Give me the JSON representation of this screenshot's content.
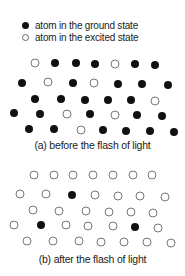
{
  "legend": {
    "ground_label": "atom in the ground state",
    "excited_label": "atom in the excited state"
  },
  "panel_a": {
    "caption": "(a) before the flash of light",
    "atoms": [
      {
        "x": 35,
        "y": 63,
        "state": "excited"
      },
      {
        "x": 55,
        "y": 63,
        "state": "ground"
      },
      {
        "x": 76,
        "y": 63,
        "state": "ground"
      },
      {
        "x": 95,
        "y": 64,
        "state": "ground"
      },
      {
        "x": 115,
        "y": 64,
        "state": "excited"
      },
      {
        "x": 135,
        "y": 64,
        "state": "ground"
      },
      {
        "x": 155,
        "y": 65,
        "state": "ground"
      },
      {
        "x": 22,
        "y": 83,
        "state": "ground"
      },
      {
        "x": 48,
        "y": 82,
        "state": "excited"
      },
      {
        "x": 73,
        "y": 83,
        "state": "ground"
      },
      {
        "x": 94,
        "y": 83,
        "state": "excited"
      },
      {
        "x": 118,
        "y": 84,
        "state": "ground"
      },
      {
        "x": 142,
        "y": 84,
        "state": "ground"
      },
      {
        "x": 168,
        "y": 85,
        "state": "ground"
      },
      {
        "x": 35,
        "y": 99,
        "state": "ground"
      },
      {
        "x": 61,
        "y": 99,
        "state": "ground"
      },
      {
        "x": 85,
        "y": 100,
        "state": "ground"
      },
      {
        "x": 108,
        "y": 100,
        "state": "ground"
      },
      {
        "x": 131,
        "y": 100,
        "state": "ground"
      },
      {
        "x": 155,
        "y": 101,
        "state": "excited"
      },
      {
        "x": 14,
        "y": 113,
        "state": "ground"
      },
      {
        "x": 40,
        "y": 114,
        "state": "ground"
      },
      {
        "x": 67,
        "y": 114,
        "state": "excited"
      },
      {
        "x": 90,
        "y": 114,
        "state": "ground"
      },
      {
        "x": 115,
        "y": 115,
        "state": "excited"
      },
      {
        "x": 137,
        "y": 115,
        "state": "ground"
      },
      {
        "x": 162,
        "y": 116,
        "state": "ground"
      },
      {
        "x": 29,
        "y": 129,
        "state": "ground"
      },
      {
        "x": 54,
        "y": 129,
        "state": "ground"
      },
      {
        "x": 81,
        "y": 130,
        "state": "excited"
      },
      {
        "x": 103,
        "y": 130,
        "state": "ground"
      },
      {
        "x": 126,
        "y": 131,
        "state": "ground"
      },
      {
        "x": 150,
        "y": 131,
        "state": "ground"
      },
      {
        "x": 174,
        "y": 132,
        "state": "ground"
      }
    ]
  },
  "panel_b": {
    "caption": "(b) after the flash of light",
    "atoms": [
      {
        "x": 34,
        "y": 175,
        "state": "excited"
      },
      {
        "x": 54,
        "y": 175,
        "state": "excited"
      },
      {
        "x": 73,
        "y": 175,
        "state": "excited"
      },
      {
        "x": 93,
        "y": 175,
        "state": "excited"
      },
      {
        "x": 113,
        "y": 175,
        "state": "excited"
      },
      {
        "x": 133,
        "y": 175,
        "state": "excited"
      },
      {
        "x": 152,
        "y": 175,
        "state": "excited"
      },
      {
        "x": 20,
        "y": 194,
        "state": "excited"
      },
      {
        "x": 46,
        "y": 194,
        "state": "excited"
      },
      {
        "x": 72,
        "y": 195,
        "state": "ground"
      },
      {
        "x": 95,
        "y": 195,
        "state": "excited"
      },
      {
        "x": 118,
        "y": 196,
        "state": "excited"
      },
      {
        "x": 140,
        "y": 196,
        "state": "excited"
      },
      {
        "x": 165,
        "y": 197,
        "state": "excited"
      },
      {
        "x": 33,
        "y": 210,
        "state": "excited"
      },
      {
        "x": 59,
        "y": 211,
        "state": "excited"
      },
      {
        "x": 86,
        "y": 211,
        "state": "excited"
      },
      {
        "x": 109,
        "y": 212,
        "state": "excited"
      },
      {
        "x": 131,
        "y": 212,
        "state": "excited"
      },
      {
        "x": 153,
        "y": 213,
        "state": "excited"
      },
      {
        "x": 14,
        "y": 225,
        "state": "excited"
      },
      {
        "x": 41,
        "y": 225,
        "state": "ground"
      },
      {
        "x": 66,
        "y": 225,
        "state": "excited"
      },
      {
        "x": 88,
        "y": 226,
        "state": "excited"
      },
      {
        "x": 113,
        "y": 226,
        "state": "excited"
      },
      {
        "x": 135,
        "y": 227,
        "state": "ground"
      },
      {
        "x": 158,
        "y": 228,
        "state": "excited"
      },
      {
        "x": 27,
        "y": 241,
        "state": "excited"
      },
      {
        "x": 53,
        "y": 241,
        "state": "excited"
      },
      {
        "x": 79,
        "y": 241,
        "state": "excited"
      },
      {
        "x": 101,
        "y": 242,
        "state": "excited"
      },
      {
        "x": 124,
        "y": 242,
        "state": "excited"
      },
      {
        "x": 147,
        "y": 242,
        "state": "excited"
      },
      {
        "x": 171,
        "y": 243,
        "state": "excited"
      }
    ]
  }
}
